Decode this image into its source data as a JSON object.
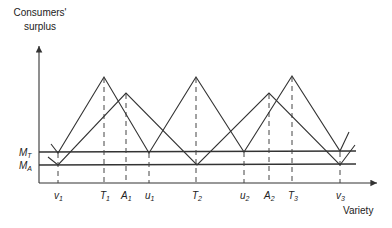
{
  "diagram": {
    "y_axis_label_line1": "Consumers'",
    "y_axis_label_line2": "surplus",
    "x_axis_label": "Variety",
    "level_labels": {
      "upper": {
        "base": "M",
        "sub": "T"
      },
      "lower": {
        "base": "M",
        "sub": "A"
      }
    },
    "tick_labels": [
      {
        "base": "v",
        "sub": "1"
      },
      {
        "base": "T",
        "sub": "1"
      },
      {
        "base": "A",
        "sub": "1"
      },
      {
        "base": "u",
        "sub": "1"
      },
      {
        "base": "T",
        "sub": "2"
      },
      {
        "base": "u",
        "sub": "2"
      },
      {
        "base": "A",
        "sub": "2"
      },
      {
        "base": "T",
        "sub": "3"
      },
      {
        "base": "v",
        "sub": "3"
      }
    ],
    "series": [
      {
        "name": "T-firms surplus",
        "peaks": [
          "T1",
          "T2",
          "T3"
        ],
        "troughs_at_level": "M_T",
        "troughs": [
          "v1",
          "u1",
          "u2",
          "v3"
        ]
      },
      {
        "name": "A-firms surplus",
        "peaks": [
          "A1",
          "A2"
        ],
        "troughs_at_level": "M_A",
        "troughs": [
          "v1",
          "T2",
          "v3"
        ]
      }
    ],
    "colors": {
      "line": "#333333",
      "text": "#222222",
      "background": "#ffffff"
    }
  }
}
